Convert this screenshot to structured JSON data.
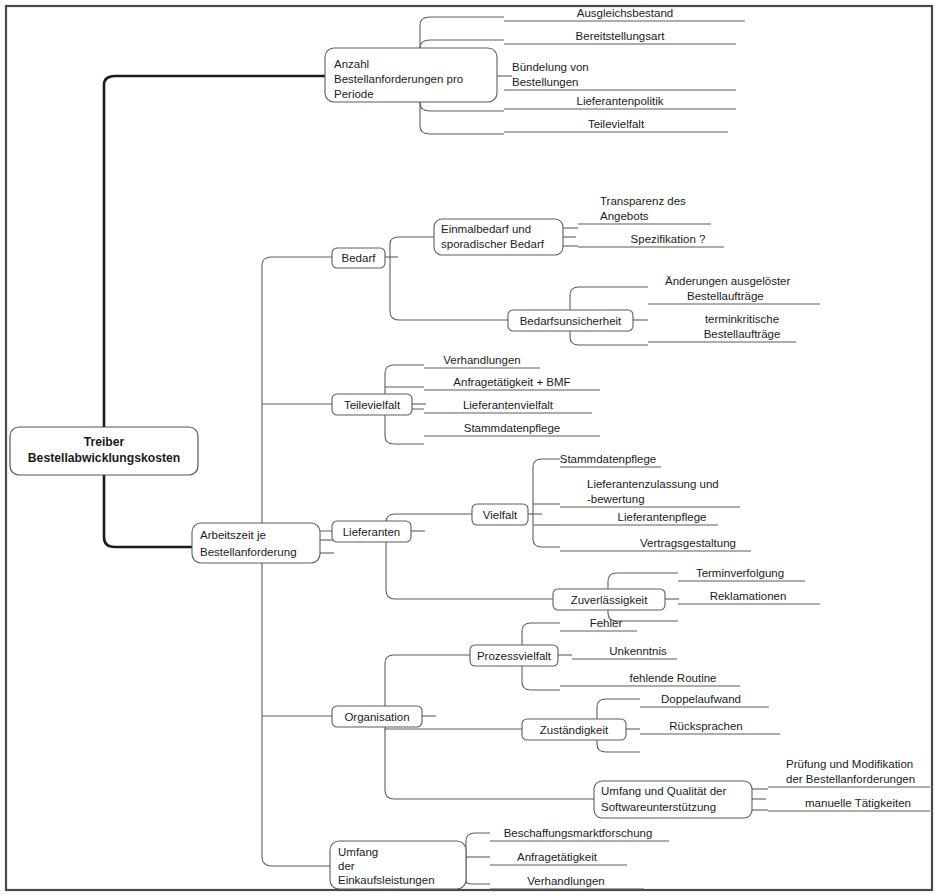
{
  "document": {
    "title": "Treiber Bestellabwicklungskosten",
    "type": "mind-map",
    "language": "de",
    "colors": {
      "frame": "#4a4a4a",
      "trunk": "#1a1a1a",
      "branch": "#5d5d5d",
      "node_fill": "#ffffff",
      "text": "#1c1c1c",
      "background": "#ffffff"
    }
  },
  "root": {
    "line1": "Treiber",
    "line2": "Bestellabwicklungskosten"
  },
  "nodes": {
    "anzahl": {
      "line1": "Anzahl",
      "line2": "Bestellanforderungen pro",
      "line3": "Periode"
    },
    "arbeitszeit": {
      "line1": "Arbeitszeit je",
      "line2": "Bestellanforderung"
    },
    "bedarf": {
      "label": "Bedarf"
    },
    "einmalbedarf": {
      "line1": "Einmalbedarf und",
      "line2": "sporadischer Bedarf"
    },
    "bedarfsunsicherheit": {
      "label": "Bedarfsunsicherheit"
    },
    "teilevielfalt": {
      "label": "Teilevielfalt"
    },
    "lieferanten": {
      "label": "Lieferanten"
    },
    "vielfalt": {
      "label": "Vielfalt"
    },
    "zuverlaessigkeit": {
      "label": "Zuverlässigkeit"
    },
    "organisation": {
      "label": "Organisation"
    },
    "prozessvielfalt": {
      "label": "Prozessvielfalt"
    },
    "zustaendigkeit": {
      "label": "Zuständigkeit"
    },
    "software": {
      "line1": "Umfang und Qualität der",
      "line2": "Softwareunterstützung"
    },
    "umfang_einkauf": {
      "line1": "Umfang",
      "line2": "der",
      "line3": "Einkaufsleistungen"
    }
  },
  "leaves": {
    "ausgleichsbestand": {
      "line1": "Ausgleichsbestand"
    },
    "bereitstellungsart": {
      "line1": "Bereitstellungsart"
    },
    "buendelung": {
      "line1": "Bündelung von",
      "line2": "Bestellungen"
    },
    "lieferantenpolitik": {
      "line1": "Lieferantenpolitik"
    },
    "teilevielfalt_leaf": {
      "line1": "Teilevielfalt"
    },
    "transparenz": {
      "line1": "Transparenz des",
      "line2": "Angebots"
    },
    "spezifikation": {
      "line1": "Spezifikation ?"
    },
    "aenderungen": {
      "line1": "Änderungen ausgelöster",
      "line2": "Bestellaufträge"
    },
    "terminkritische": {
      "line1": "terminkritische",
      "line2": "Bestellaufträge"
    },
    "verhandlungen_tv": {
      "line1": "Verhandlungen"
    },
    "anfrage_bmf": {
      "line1": "Anfragetätigkeit + BMF"
    },
    "lieferantenvielfalt": {
      "line1": "Lieferantenvielfalt"
    },
    "stammdatenpflege_tv": {
      "line1": "Stammdatenpflege"
    },
    "stammdatenpflege_v": {
      "line1": "Stammdatenpflege"
    },
    "zulassung": {
      "line1": "Lieferantenzulassung und",
      "line2": "-bewertung"
    },
    "lieferantenpflege": {
      "line1": "Lieferantenpflege"
    },
    "vertragsgestaltung": {
      "line1": "Vertragsgestaltung"
    },
    "terminverfolgung": {
      "line1": "Terminverfolgung"
    },
    "reklamationen": {
      "line1": "Reklamationen"
    },
    "fehler": {
      "line1": "Fehler"
    },
    "unkenntnis": {
      "line1": "Unkenntnis"
    },
    "fehlende_routine": {
      "line1": "fehlende Routine"
    },
    "doppelaufwand": {
      "line1": "Doppelaufwand"
    },
    "ruecksprachen": {
      "line1": "Rücksprachen"
    },
    "pruefung": {
      "line1": "Prüfung und Modifikation",
      "line2": "der Bestellanforderungen"
    },
    "manuelle": {
      "line1": "manuelle Tätigkeiten"
    },
    "beschaffungsmarktforschung": {
      "line1": "Beschaffungsmarktforschung"
    },
    "anfragetaetigkeit": {
      "line1": "Anfragetätigkeit"
    },
    "verhandlungen_ue": {
      "line1": "Verhandlungen"
    }
  },
  "tree_outline": {
    "root": "Treiber Bestellabwicklungskosten",
    "children": [
      {
        "label": "Anzahl Bestellanforderungen pro Periode",
        "children": [
          "Ausgleichsbestand",
          "Bereitstellungsart",
          "Bündelung von Bestellungen",
          "Lieferantenpolitik",
          "Teilevielfalt"
        ]
      },
      {
        "label": "Arbeitszeit je Bestellanforderung",
        "children": [
          {
            "label": "Bedarf",
            "children": [
              {
                "label": "Einmalbedarf und sporadischer Bedarf",
                "children": [
                  "Transparenz des Angebots",
                  "Spezifikation ?"
                ]
              },
              {
                "label": "Bedarfsunsicherheit",
                "children": [
                  "Änderungen ausgelöster Bestellaufträge",
                  "terminkritische Bestellaufträge"
                ]
              }
            ]
          },
          {
            "label": "Teilevielfalt",
            "children": [
              "Verhandlungen",
              "Anfragetätigkeit + BMF",
              "Lieferantenvielfalt",
              "Stammdatenpflege"
            ]
          },
          {
            "label": "Lieferanten",
            "children": [
              {
                "label": "Vielfalt",
                "children": [
                  "Stammdatenpflege",
                  "Lieferantenzulassung und -bewertung",
                  "Lieferantenpflege",
                  "Vertragsgestaltung"
                ]
              },
              {
                "label": "Zuverlässigkeit",
                "children": [
                  "Terminverfolgung",
                  "Reklamationen"
                ]
              }
            ]
          },
          {
            "label": "Organisation",
            "children": [
              {
                "label": "Prozessvielfalt",
                "children": [
                  "Fehler",
                  "Unkenntnis",
                  "fehlende Routine"
                ]
              },
              {
                "label": "Zuständigkeit",
                "children": [
                  "Doppelaufwand",
                  "Rücksprachen"
                ]
              },
              {
                "label": "Umfang und Qualität der Softwareunterstützung",
                "children": [
                  "Prüfung und Modifikation der Bestellanforderungen",
                  "manuelle Tätigkeiten"
                ]
              }
            ]
          },
          {
            "label": "Umfang der Einkaufsleistungen",
            "children": [
              "Beschaffungsmarktforschung",
              "Anfragetätigkeit",
              "Verhandlungen"
            ]
          }
        ]
      }
    ]
  }
}
